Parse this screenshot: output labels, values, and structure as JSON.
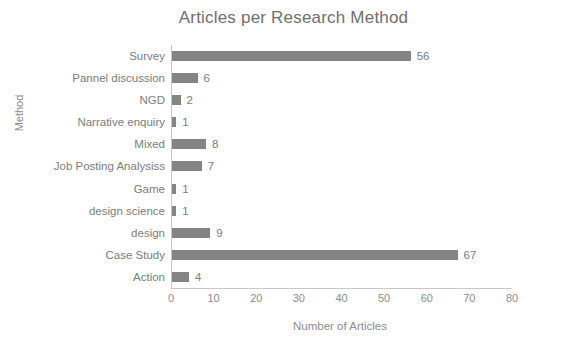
{
  "chart_data": {
    "type": "bar",
    "orientation": "horizontal",
    "title": "Articles per Research Method",
    "xlabel": "Number of Articles",
    "ylabel": "Method",
    "xlim": [
      0,
      80
    ],
    "xticks": [
      0,
      10,
      20,
      30,
      40,
      50,
      60,
      70,
      80
    ],
    "grid": false,
    "legend": false,
    "bar_color": "#848484",
    "text_color": "#7d7d7d",
    "axis_color": "#c9c9c9",
    "background": "#ffffff",
    "categories": [
      "Survey",
      "Pannel discussion",
      "NGD",
      "Narrative enquiry",
      "Mixed",
      "Job Posting Analysiss",
      "Game",
      "design science",
      "design",
      "Case Study",
      "Action"
    ],
    "values": [
      56,
      6,
      2,
      1,
      8,
      7,
      1,
      1,
      9,
      67,
      4
    ],
    "data_labels": [
      "56",
      "6",
      "2",
      "1",
      "8",
      "7",
      "1",
      "1",
      "9",
      "67",
      "4"
    ]
  }
}
